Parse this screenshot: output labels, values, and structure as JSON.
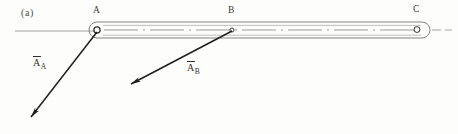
{
  "figure": {
    "panel_label": "(a)",
    "caption_present": false,
    "background_color": "#fdfdfc",
    "ink_color": "#2b2b2b",
    "faint_ink_color": "#8a8a86"
  },
  "nodes": [
    {
      "id": "A",
      "label": "A",
      "x": 97,
      "y": 30,
      "label_x": 93,
      "label_y": 6,
      "joint": "pin-circle",
      "radius": 3.1
    },
    {
      "id": "B",
      "label": "B",
      "x": 232,
      "y": 30,
      "label_x": 228,
      "label_y": 6,
      "joint": "pin-dot",
      "radius": 2.0
    },
    {
      "id": "C",
      "label": "C",
      "x": 417,
      "y": 29,
      "label_x": 413,
      "label_y": 5,
      "joint": "pin-circle",
      "radius": 2.8
    }
  ],
  "rod": {
    "name": "link-ABC",
    "from_x": 97,
    "to_x": 430,
    "center_y": 30,
    "half_height": 8,
    "outline_color": "#7d7d79",
    "centerline_style": "dashed",
    "centerline_color": "#8a8a86"
  },
  "reference_line": {
    "name": "horizontal-datum",
    "x1": 15,
    "x2": 97,
    "y": 31,
    "right_x1": 432,
    "right_x2": 452,
    "color": "#9a9a96"
  },
  "vectors": [
    {
      "id": "A_A",
      "name": "acceleration-vector-a-at-A",
      "label_base": "A",
      "label_sub": "A",
      "overbar": true,
      "tail_x": 97,
      "tail_y": 32,
      "head_x": 31,
      "head_y": 117,
      "label_x": 33,
      "label_y": 57,
      "color": "#1f1f1f"
    },
    {
      "id": "A_B",
      "name": "acceleration-vector-a-at-B",
      "label_base": "A",
      "label_sub": "B",
      "overbar": true,
      "tail_x": 232,
      "tail_y": 31,
      "head_x": 131,
      "head_y": 84,
      "label_x": 187,
      "label_y": 62,
      "color": "#1f1f1f"
    }
  ]
}
